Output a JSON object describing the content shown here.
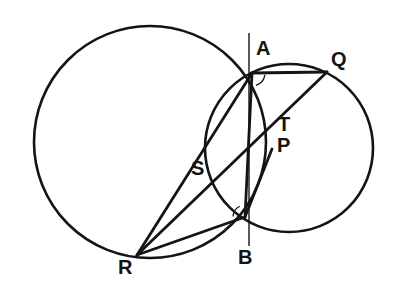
{
  "figure": {
    "kind": "euclidean-geometry-diagram",
    "background_color": "#ffffff",
    "stroke_color": "#141414",
    "canvas": {
      "width": 403,
      "height": 290
    },
    "circles": [
      {
        "name": "large-circle",
        "cx": 150,
        "cy": 142,
        "r": 116,
        "stroke_width": 2.6
      },
      {
        "name": "small-circle",
        "cx": 289,
        "cy": 148,
        "r": 84,
        "stroke_width": 2.6
      }
    ],
    "points": [
      {
        "id": "A",
        "x": 252,
        "y": 73
      },
      {
        "id": "Q",
        "x": 327,
        "y": 72
      },
      {
        "id": "T",
        "x": 277,
        "y": 128
      },
      {
        "id": "P",
        "x": 272,
        "y": 149
      },
      {
        "id": "S",
        "x": 216,
        "y": 172
      },
      {
        "id": "B",
        "x": 245,
        "y": 217
      },
      {
        "id": "R",
        "x": 137,
        "y": 255
      }
    ],
    "segments": [
      {
        "name": "chord-AQ",
        "from": "A",
        "to": "Q",
        "stroke_width": 2.8
      },
      {
        "name": "line-RQ-through-S-T",
        "from": "R",
        "to": "Q",
        "stroke_width": 2.8
      },
      {
        "name": "line-AP-to-R",
        "from": "A",
        "to": "R",
        "stroke_width": 2.8
      },
      {
        "name": "segment-RB",
        "from": "R",
        "to": "B",
        "stroke_width": 2.8
      },
      {
        "name": "segment-BQ-via-P",
        "from": "B",
        "to": "P",
        "stroke_width": 2.8
      },
      {
        "name": "segment-BA",
        "from": "B",
        "to": "A",
        "stroke_width": 2.8
      }
    ],
    "vertical_line": {
      "name": "radical-axis-AB",
      "x": 249,
      "y_top": 33,
      "y_bottom": 246,
      "stroke_width": 1.4
    },
    "angle_markers": [
      {
        "name": "angle-marker-at-A",
        "at": "A",
        "radius": 13,
        "start_deg": 8,
        "end_deg": 72
      },
      {
        "name": "angle-marker-at-B",
        "at": "B",
        "radius": 12,
        "start_deg": 182,
        "end_deg": 244
      }
    ]
  },
  "labels": [
    {
      "name": "point-label-A",
      "text": "A",
      "x": 256,
      "y": 38,
      "size": 20
    },
    {
      "name": "point-label-Q",
      "text": "Q",
      "x": 331,
      "y": 49,
      "size": 20
    },
    {
      "name": "point-label-T",
      "text": "T",
      "x": 278,
      "y": 114,
      "size": 20
    },
    {
      "name": "point-label-P",
      "text": "P",
      "x": 277,
      "y": 135,
      "size": 20
    },
    {
      "name": "point-label-S",
      "text": "S",
      "x": 191,
      "y": 158,
      "size": 20
    },
    {
      "name": "point-label-B",
      "text": "B",
      "x": 238,
      "y": 247,
      "size": 20
    },
    {
      "name": "point-label-R",
      "text": "R",
      "x": 118,
      "y": 257,
      "size": 20
    }
  ]
}
